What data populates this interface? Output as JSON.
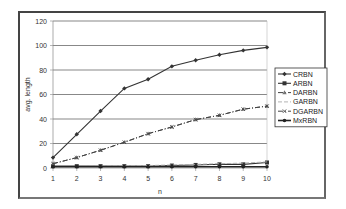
{
  "chart_data": {
    "type": "line",
    "title": "",
    "xlabel": "n",
    "ylabel": "avg. length",
    "x": [
      1,
      2,
      3,
      4,
      5,
      6,
      7,
      8,
      9,
      10
    ],
    "ylim": [
      0,
      120
    ],
    "yticks": [
      0,
      20,
      40,
      60,
      80,
      100,
      120
    ],
    "grid": true,
    "legend_position": "right",
    "series": [
      {
        "name": "CRBN",
        "marker": "diamond",
        "style": "solid",
        "values": [
          8.5,
          27.5,
          46.5,
          65,
          72.5,
          83,
          88,
          92.5,
          96,
          98.5
        ]
      },
      {
        "name": "ARBN",
        "marker": "square",
        "style": "solid",
        "values": [
          1.5,
          1.5,
          1.5,
          1.5,
          1.5,
          2,
          2.5,
          3,
          3,
          4.5
        ]
      },
      {
        "name": "DARBN",
        "marker": "triangle",
        "style": "dashdot",
        "values": [
          3.5,
          8.5,
          14.5,
          21,
          28,
          33.5,
          39.5,
          43,
          48,
          50.5
        ]
      },
      {
        "name": "GARBN",
        "marker": "none",
        "style": "dashed-light",
        "values": [
          1,
          1.2,
          1.5,
          1.8,
          2,
          2.5,
          3,
          3.5,
          4,
          5
        ]
      },
      {
        "name": "DGARBN",
        "marker": "x",
        "style": "dashdot",
        "values": [
          3.5,
          8.5,
          14.5,
          21,
          28,
          33.5,
          39.5,
          43,
          48,
          50.5
        ]
      },
      {
        "name": "MxRBN",
        "marker": "circle",
        "style": "solid-bold",
        "values": [
          1,
          1,
          1,
          1,
          1,
          1,
          1,
          1,
          1,
          1
        ]
      }
    ]
  }
}
